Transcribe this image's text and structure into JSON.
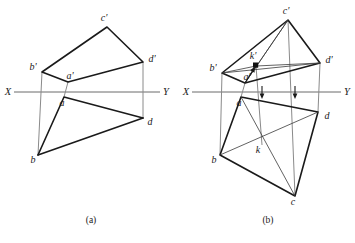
{
  "figure": {
    "caption_left": "(a)",
    "caption_right": "(b)",
    "caption_bottom": "",
    "stroke_color": "#1a1a1a",
    "axis_color": "#6b6b6b",
    "thin_color": "#4a4a4a",
    "background": "#ffffff"
  },
  "axis": {
    "x_label": "X",
    "y_label": "Y"
  },
  "panel_a": {
    "name": "(a)",
    "labels": {
      "c_prime": "c'",
      "b_prime": "b'",
      "a_prime": "a'",
      "d_prime": "d'",
      "a": "a",
      "b": "b",
      "d": "d"
    },
    "points": {
      "c_prime": [
        107,
        27
      ],
      "b_prime": [
        42,
        72
      ],
      "a_prime": [
        68,
        82
      ],
      "d_prime": [
        143,
        62
      ],
      "a": [
        64,
        97
      ],
      "b": [
        38,
        155
      ],
      "d": [
        143,
        118
      ]
    },
    "axis_y": 92,
    "axis_x_start": 14,
    "axis_x_end": 160
  },
  "panel_b": {
    "name": "(b)",
    "labels": {
      "c_prime": "c'",
      "b_prime": "b'",
      "a_prime": "a'",
      "k_prime": "k'",
      "d_prime": "d'",
      "a": "a",
      "b": "b",
      "k": "k",
      "d": "d",
      "c": "c"
    },
    "points": {
      "c_prime": [
        288,
        20
      ],
      "b_prime": [
        222,
        73
      ],
      "a_prime": [
        245,
        83
      ],
      "k_prime": [
        256,
        66
      ],
      "d_prime": [
        320,
        63
      ],
      "a": [
        241,
        97
      ],
      "b": [
        220,
        155
      ],
      "k": [
        262,
        145
      ],
      "d": [
        318,
        112
      ],
      "c": [
        295,
        196
      ]
    },
    "axis_y": 92,
    "axis_x_start": 192,
    "axis_x_end": 341
  }
}
